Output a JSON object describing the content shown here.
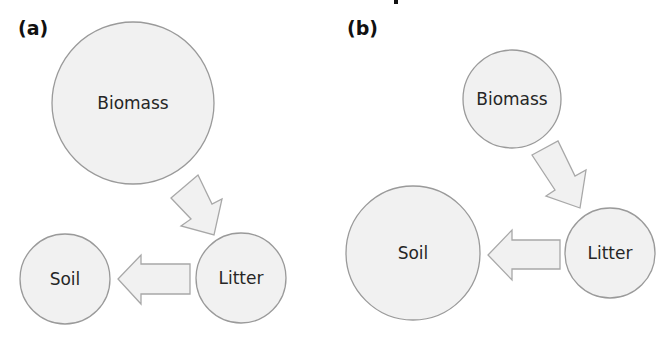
{
  "diagram": {
    "type": "flow",
    "panels": [
      {
        "label": "(a)",
        "nodes": [
          {
            "id": "biomass",
            "label": "Biomass",
            "relative_size": "large"
          },
          {
            "id": "litter",
            "label": "Litter",
            "relative_size": "medium"
          },
          {
            "id": "soil",
            "label": "Soil",
            "relative_size": "medium"
          }
        ],
        "edges": [
          {
            "from": "biomass",
            "to": "litter"
          },
          {
            "from": "litter",
            "to": "soil"
          }
        ]
      },
      {
        "label": "(b)",
        "nodes": [
          {
            "id": "biomass",
            "label": "Biomass",
            "relative_size": "medium"
          },
          {
            "id": "litter",
            "label": "Litter",
            "relative_size": "medium"
          },
          {
            "id": "soil",
            "label": "Soil",
            "relative_size": "large"
          }
        ],
        "edges": [
          {
            "from": "biomass",
            "to": "litter"
          },
          {
            "from": "litter",
            "to": "soil"
          }
        ]
      }
    ],
    "colors": {
      "node_fill": "#f1f1f1",
      "node_stroke": "#9a9a9a",
      "arrow_fill": "#f1f1f1",
      "arrow_stroke": "#a8a8a8",
      "text": "#262626"
    }
  }
}
